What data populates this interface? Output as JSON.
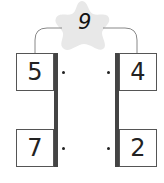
{
  "diagram": {
    "top": {
      "value": "9",
      "shape": "star",
      "star_color": "#e8e8e8"
    },
    "left_column": [
      {
        "value": "5"
      },
      {
        "value": "7"
      }
    ],
    "right_column": [
      {
        "value": "4"
      },
      {
        "value": "2"
      }
    ],
    "colors": {
      "bar": "#444444",
      "box_border": "#555555",
      "connector": "#888888"
    }
  }
}
